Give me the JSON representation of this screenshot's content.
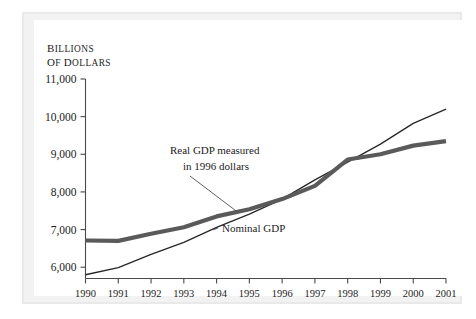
{
  "chart_data": {
    "type": "line",
    "title": "",
    "subtitle": "",
    "xlabel": "",
    "ylabel": "Billions of dollars",
    "ylabel_line1": "Billions",
    "ylabel_line2": "of dollars",
    "grid": false,
    "legend_position": "inline-annotation",
    "x": [
      1990,
      1991,
      1992,
      1993,
      1994,
      1995,
      1996,
      1997,
      1998,
      1999,
      2000,
      2001
    ],
    "xlim": [
      1990,
      2001
    ],
    "ylim": [
      5700,
      11000
    ],
    "yticks": [
      6000,
      7000,
      8000,
      9000,
      10000,
      11000
    ],
    "ytick_labels": [
      "6,000",
      "7,000",
      "8,000",
      "9,000",
      "10,000",
      "11,000"
    ],
    "xtick_labels": [
      "1990",
      "1991",
      "1992",
      "1993",
      "1994",
      "1995",
      "1996",
      "1997",
      "1998",
      "1999",
      "2000",
      "2001"
    ],
    "series": [
      {
        "name": "Real GDP measured in 1996 dollars",
        "style": "thick-gray",
        "color": "#5a5a5a",
        "values": [
          6710,
          6700,
          6890,
          7060,
          7350,
          7540,
          7810,
          8160,
          8860,
          9000,
          9230,
          9350
        ]
      },
      {
        "name": "Nominal GDP",
        "style": "thin-black",
        "color": "#262626",
        "values": [
          5800,
          5990,
          6340,
          6660,
          7060,
          7410,
          7810,
          8320,
          8790,
          9270,
          9820,
          10200
        ]
      }
    ],
    "annotations": [
      {
        "id": "real-gdp-annotation",
        "line1": "Real GDP measured",
        "line2": "in 1996 dollars",
        "points_to_year": 1994.6
      },
      {
        "id": "nominal-gdp-annotation",
        "line1": "Nominal GDP",
        "line2": "",
        "points_to_year": 1993.9
      }
    ]
  },
  "figure": {
    "background_color": "#ffffff",
    "frame_color": "#e9e9e9",
    "axis_color": "#4a4a4a"
  }
}
